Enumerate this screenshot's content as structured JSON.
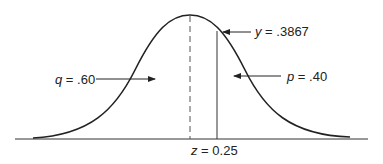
{
  "diagram": {
    "title": "",
    "type": "normal-distribution-curve",
    "labels": {
      "y_label_var": "y",
      "y_label_val": " = .3867",
      "q_label_var": "q",
      "q_label_val": " = .60",
      "p_label_var": "p",
      "p_label_val": " = .40",
      "z_label_var": "z",
      "z_label_val": " = 0.25"
    },
    "values": {
      "y": 0.3867,
      "q": 0.6,
      "p": 0.4,
      "z": 0.25
    },
    "colors": {
      "line": "#222222",
      "background": "#ffffff"
    }
  }
}
